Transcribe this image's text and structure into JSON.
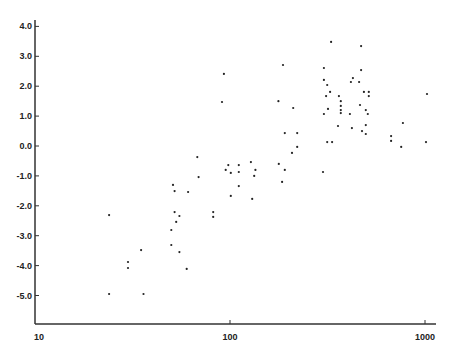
{
  "chart_data": {
    "type": "scatter",
    "title": "",
    "xlabel": "",
    "ylabel": "",
    "xscale": "log",
    "xlim": [
      10,
      1100
    ],
    "ylim": [
      -5.9,
      4.25
    ],
    "grid": false,
    "legend": null,
    "x_ticks": [
      {
        "value": 10,
        "label": "10"
      },
      {
        "value": 100,
        "label": "100"
      },
      {
        "value": 1000,
        "label": "1000"
      }
    ],
    "y_ticks": [
      {
        "value": 4,
        "label": "4.0"
      },
      {
        "value": 3,
        "label": "3.0"
      },
      {
        "value": 2,
        "label": "2.0"
      },
      {
        "value": 1,
        "label": "1.0"
      },
      {
        "value": 0,
        "label": "0.0"
      },
      {
        "value": -1,
        "label": "-1.0"
      },
      {
        "value": -2,
        "label": "-2.0"
      },
      {
        "value": -3,
        "label": "-3.0"
      },
      {
        "value": -4,
        "label": "-4.0"
      },
      {
        "value": -5,
        "label": "-5.0"
      }
    ],
    "series": [
      {
        "name": "data",
        "color": "#222222",
        "points": [
          [
            24,
            -2.31
          ],
          [
            24,
            -4.95
          ],
          [
            30,
            -3.88
          ],
          [
            30,
            -4.08
          ],
          [
            35,
            -3.48
          ],
          [
            36,
            -4.95
          ],
          [
            50,
            -3.31
          ],
          [
            50,
            -2.81
          ],
          [
            52,
            -2.21
          ],
          [
            53,
            -2.54
          ],
          [
            55,
            -2.34
          ],
          [
            55,
            -3.55
          ],
          [
            51,
            -1.3
          ],
          [
            52,
            -1.51
          ],
          [
            61,
            -1.54
          ],
          [
            60,
            -4.11
          ],
          [
            68,
            -0.37
          ],
          [
            69,
            -1.04
          ],
          [
            82,
            -2.21
          ],
          [
            82,
            -2.37
          ],
          [
            91,
            1.47
          ],
          [
            93,
            2.41
          ],
          [
            95,
            -0.8
          ],
          [
            98,
            -0.64
          ],
          [
            101,
            -0.9
          ],
          [
            101,
            -1.67
          ],
          [
            111,
            -0.64
          ],
          [
            111,
            -0.87
          ],
          [
            111,
            -1.34
          ],
          [
            128,
            -0.54
          ],
          [
            135,
            -0.8
          ],
          [
            133,
            -1.0
          ],
          [
            130,
            -1.77
          ],
          [
            177,
            1.5
          ],
          [
            187,
            2.71
          ],
          [
            211,
            1.27
          ],
          [
            178,
            -0.6
          ],
          [
            191,
            -0.8
          ],
          [
            185,
            -1.2
          ],
          [
            191,
            0.43
          ],
          [
            221,
            0.43
          ],
          [
            221,
            -0.03
          ],
          [
            208,
            -0.23
          ],
          [
            300,
            -0.87
          ],
          [
            303,
            1.07
          ],
          [
            318,
            1.24
          ],
          [
            303,
            2.61
          ],
          [
            303,
            2.21
          ],
          [
            315,
            2.04
          ],
          [
            326,
            1.81
          ],
          [
            311,
            1.67
          ],
          [
            330,
            3.48
          ],
          [
            315,
            0.13
          ],
          [
            334,
            0.13
          ],
          [
            358,
            0.67
          ],
          [
            362,
            1.67
          ],
          [
            370,
            1.5
          ],
          [
            370,
            1.34
          ],
          [
            370,
            1.2
          ],
          [
            370,
            1.1
          ],
          [
            412,
            1.07
          ],
          [
            422,
            0.6
          ],
          [
            417,
            2.14
          ],
          [
            427,
            2.27
          ],
          [
            459,
            2.14
          ],
          [
            470,
            3.34
          ],
          [
            470,
            2.54
          ],
          [
            475,
            0.5
          ],
          [
            486,
            1.81
          ],
          [
            464,
            1.37
          ],
          [
            497,
            1.2
          ],
          [
            497,
            0.7
          ],
          [
            497,
            0.4
          ],
          [
            509,
            1.07
          ],
          [
            515,
            1.81
          ],
          [
            515,
            1.67
          ],
          [
            670,
            0.33
          ],
          [
            670,
            0.17
          ],
          [
            755,
            -0.03
          ],
          [
            770,
            0.77
          ],
          [
            1012,
            0.13
          ],
          [
            1024,
            1.74
          ]
        ]
      }
    ]
  },
  "layout": {
    "plot_left": 35,
    "plot_right": 436,
    "plot_top": 20,
    "plot_bottom": 324,
    "x_px_per_decade": 195,
    "y_zero_px": 146,
    "y_px_per_unit": 29.9,
    "axis_color": "#333333"
  }
}
